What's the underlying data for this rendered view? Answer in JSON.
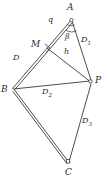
{
  "figure": {
    "stroke_color": "#3a3a3a",
    "label_color": "#2b2b2b",
    "background": "#ffffff",
    "width": 108,
    "height": 183
  },
  "vertices": [
    {
      "id": "A",
      "label": "A",
      "x": 70,
      "y": 18,
      "marker": "circle"
    },
    {
      "id": "B",
      "label": "B",
      "x": 11,
      "y": 90,
      "marker": "none"
    },
    {
      "id": "C",
      "label": "C",
      "x": 68,
      "y": 166,
      "marker": "square"
    },
    {
      "id": "P",
      "label": "P",
      "x": 92,
      "y": 82,
      "marker": "circle"
    },
    {
      "id": "M",
      "label": "M",
      "x": 40,
      "y": 47,
      "marker": "none"
    }
  ],
  "edge_labels": [
    {
      "id": "q",
      "text": "q",
      "sub": "",
      "x": 51,
      "y": 22
    },
    {
      "id": "D",
      "text": "D",
      "sub": "",
      "x": 16,
      "y": 59
    },
    {
      "id": "D1",
      "text": "D",
      "sub": "1",
      "x": 85,
      "y": 41
    },
    {
      "id": "D2",
      "text": "D",
      "sub": "2",
      "x": 46,
      "y": 91
    },
    {
      "id": "D3",
      "text": "D",
      "sub": "3",
      "x": 86,
      "y": 121
    },
    {
      "id": "h",
      "text": "h",
      "sub": "",
      "x": 68,
      "y": 52
    }
  ],
  "angle_labels": [
    {
      "id": "beta",
      "text": "β",
      "x": 68,
      "y": 36
    }
  ],
  "marks": [
    {
      "id": "right-angle-at-M",
      "type": "right-angle"
    },
    {
      "id": "angle-arc-at-A",
      "type": "arc"
    }
  ]
}
